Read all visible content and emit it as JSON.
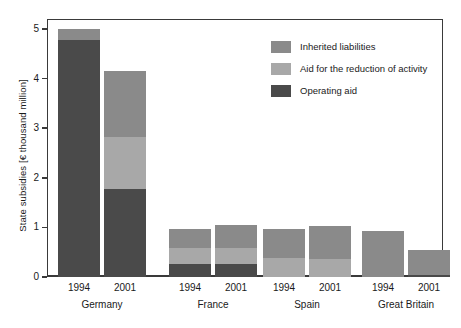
{
  "chart_data": {
    "type": "bar",
    "title": "",
    "xlabel": "",
    "ylabel": "State subsidies [€ thousand million]",
    "ylim": [
      0,
      5.2
    ],
    "yticks": [
      "0",
      "1",
      "2",
      "3",
      "4",
      "5"
    ],
    "ytick_values": [
      0,
      1,
      2,
      3,
      4,
      5
    ],
    "grid": false,
    "stacked": true,
    "legend_position": "top-right",
    "groups": [
      "Germany",
      "France",
      "Spain",
      "Great Britain"
    ],
    "categories": [
      "1994",
      "2001",
      "1994",
      "2001",
      "1994",
      "2001",
      "1994",
      "2001"
    ],
    "series": [
      {
        "name": "Operating aid",
        "color": "#4a4a4a",
        "values": [
          4.78,
          1.77,
          0.26,
          0.26,
          0.0,
          0.0,
          0.0,
          0.05
        ]
      },
      {
        "name": "Aid for the reduction of activity",
        "color": "#a8a8a8",
        "values": [
          0.0,
          1.05,
          0.32,
          0.32,
          0.38,
          0.36,
          0.0,
          0.0
        ]
      },
      {
        "name": "Inherited liabilities",
        "color": "#8a8a8a",
        "values": [
          0.22,
          1.33,
          0.39,
          0.47,
          0.59,
          0.67,
          0.93,
          0.5
        ]
      }
    ],
    "totals": [
      5.0,
      4.15,
      0.97,
      1.05,
      0.97,
      1.03,
      0.93,
      0.55
    ]
  },
  "legend": {
    "items": [
      {
        "label": "Inherited liabilities",
        "color": "#8a8a8a"
      },
      {
        "label": "Aid for the reduction of activity",
        "color": "#a8a8a8"
      },
      {
        "label": "Operating aid",
        "color": "#4a4a4a"
      }
    ]
  },
  "axis": {
    "y_title": "State subsidies [€ thousand million]"
  },
  "colors": {
    "frame": "#3a3a3a",
    "background": "#ffffff",
    "inherited_liabilities": "#8a8a8a",
    "aid_reduction_activity": "#a8a8a8",
    "operating_aid": "#4a4a4a"
  }
}
